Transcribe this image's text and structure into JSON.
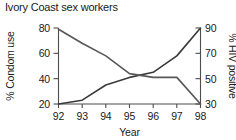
{
  "chart_data": {
    "type": "line",
    "title": "Ivory Coast sex workers",
    "xlabel": "Year",
    "ylabel": "% Condom use",
    "y2label": "% HIV positive",
    "categories": [
      "92",
      "93",
      "94",
      "95",
      "96",
      "97",
      "98"
    ],
    "x": [
      1992,
      1993,
      1994,
      1995,
      1996,
      1997,
      1998
    ],
    "xtick_labels": [
      "92",
      "93",
      "94",
      "95",
      "96",
      "97",
      "98"
    ],
    "ylim": [
      20,
      80
    ],
    "ytick_labels": [
      "20",
      "40",
      "60",
      "80"
    ],
    "yticks": [
      20,
      40,
      60,
      80
    ],
    "y2lim": [
      30,
      90
    ],
    "y2tick_labels": [
      "30",
      "50",
      "70",
      "90"
    ],
    "y2ticks": [
      30,
      50,
      70,
      90
    ],
    "grid": false,
    "legend": "none",
    "series": [
      {
        "name": "% Condom use",
        "axis": "left",
        "color": "#3a3a3a",
        "values": [
          20,
          23,
          35,
          41,
          45,
          58,
          80
        ]
      },
      {
        "name": "% HIV positive",
        "axis": "right",
        "color": "#575757",
        "values": [
          89,
          78,
          68,
          54,
          51,
          51,
          30
        ]
      }
    ]
  },
  "axis_colors": {
    "spine": "#4d4d4d",
    "text": "#1a1a1a"
  }
}
